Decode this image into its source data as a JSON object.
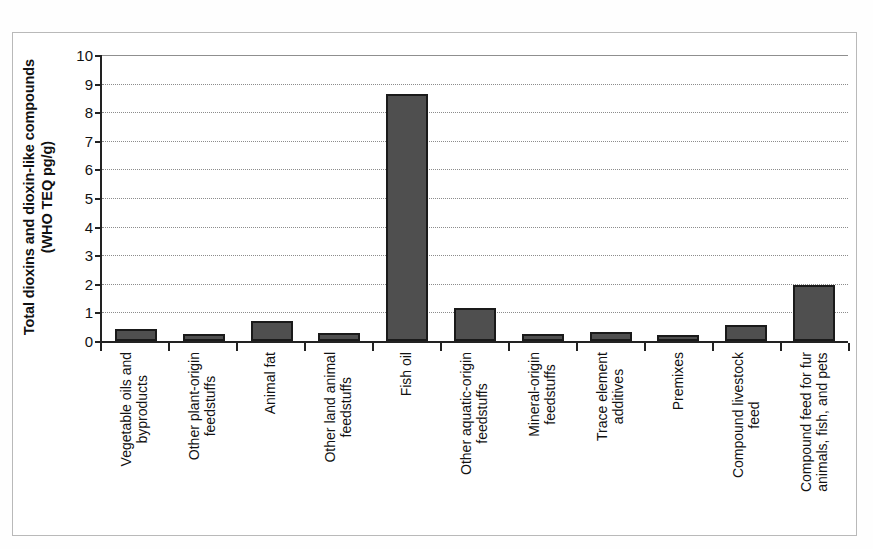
{
  "chart_data": {
    "type": "bar",
    "title": "",
    "subtitle": "",
    "xlabel": "",
    "ylabel": "Total dioxins and dioxin-like compounds (WHO TEQ pg/g)",
    "ylabel_lines": [
      "Total dioxins and dioxin-like compounds",
      "(WHO TEQ pg/g)"
    ],
    "ylim": [
      0,
      10
    ],
    "ytick_labels": [
      "10",
      "9",
      "8",
      "7",
      "6",
      "5",
      "4",
      "3",
      "2",
      "1",
      "0"
    ],
    "ytick_values": [
      10,
      9,
      8,
      7,
      6,
      5,
      4,
      3,
      2,
      1,
      0
    ],
    "grid": true,
    "grid_orientation": "horizontal",
    "legend": false,
    "legend_position": "none",
    "bar_color": "#4f4f4f",
    "bar_edge_color": "#1a1a1a",
    "categories": [
      "Vegetable oils and byproducts",
      "Other plant-origin feedstuffs",
      "Animal fat",
      "Other land animal feedstuffs",
      "Fish oil",
      "Other aquatic-origin feedstuffs",
      "Mineral-origin feedstuffs",
      "Trace element additives",
      "Premixes",
      "Compound livestock feed",
      "Compound feed for fur animals, fish, and pets"
    ],
    "category_lines": [
      [
        "Vegetable oils and",
        "byproducts"
      ],
      [
        "Other plant-origin",
        "feedstuffs"
      ],
      [
        "Animal fat"
      ],
      [
        "Other land animal",
        "feedstuffs"
      ],
      [
        "Fish oil"
      ],
      [
        "Other aquatic-origin",
        "feedstuffs"
      ],
      [
        "Mineral-origin",
        "feedstuffs"
      ],
      [
        "Trace element",
        "additives"
      ],
      [
        "Premixes"
      ],
      [
        "Compound livestock",
        "feed"
      ],
      [
        "Compound feed for fur",
        "animals, fish, and pets"
      ]
    ],
    "values": [
      0.42,
      0.25,
      0.7,
      0.27,
      8.62,
      1.15,
      0.26,
      0.33,
      0.21,
      0.55,
      1.95
    ]
  }
}
